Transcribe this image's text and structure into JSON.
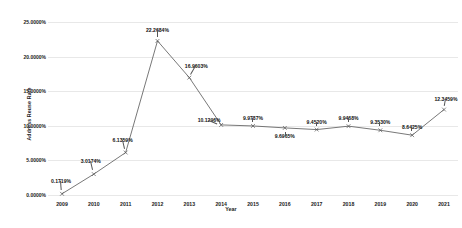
{
  "chart_data": {
    "type": "line",
    "title": "",
    "xlabel": "Year",
    "ylabel": "Address Reuse Rate",
    "categories": [
      "2009",
      "2010",
      "2011",
      "2012",
      "2013",
      "2014",
      "2015",
      "2016",
      "2017",
      "2018",
      "2019",
      "2020",
      "2021"
    ],
    "values": [
      0.1719,
      3.0174,
      6.1359,
      22.2684,
      16.9603,
      10.1296,
      9.9787,
      9.6965,
      9.452,
      9.9468,
      9.353,
      8.6425,
      12.3459
    ],
    "point_labels": [
      "0.1719%",
      "3.0174%",
      "6.1359%",
      "22.2684%",
      "16.9603%",
      "10.1296%",
      "9.9787%",
      "9.6965%",
      "9.4520%",
      "9.9468%",
      "9.3530%",
      "8.6425%",
      "12.3459%"
    ],
    "ylim": [
      0,
      25
    ],
    "yticks": [
      0,
      5,
      10,
      15,
      20,
      25
    ],
    "ytick_labels": [
      "0.0000%",
      "5.0000%",
      "10.0000%",
      "15.0000%",
      "20.0000%",
      "25.0000%"
    ],
    "grid": "horizontal",
    "legend": "none",
    "series_color": "#555555",
    "grid_color": "#e8e8e8",
    "marker": "x"
  }
}
